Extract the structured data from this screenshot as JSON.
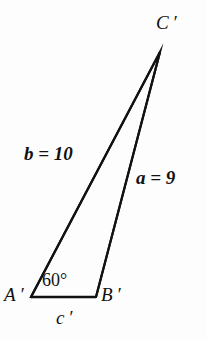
{
  "figure": {
    "type": "geometry-diagram",
    "shape": "triangle",
    "background_color": "#fdfdfd",
    "line_color": "#111111",
    "line_width_px": 2,
    "vertices": [
      {
        "id": "A",
        "label": "A ′",
        "x": 31,
        "y": 297
      },
      {
        "id": "B",
        "label": "B ′",
        "x": 96,
        "y": 297
      },
      {
        "id": "C",
        "label": "C ′",
        "x": 160,
        "y": 52
      }
    ],
    "sides": [
      {
        "id": "a",
        "label": "a = 9",
        "from": "B",
        "to": "C",
        "value": 9,
        "symbol": "a"
      },
      {
        "id": "b",
        "label": "b = 10",
        "from": "A",
        "to": "C",
        "value": 10,
        "symbol": "b"
      },
      {
        "id": "c",
        "label": "c ′",
        "from": "A",
        "to": "B",
        "value": null,
        "symbol": "c"
      }
    ],
    "angles": [
      {
        "at": "A",
        "label": "60°",
        "degrees": 60
      }
    ],
    "labels": {
      "vertex_C": "C ′",
      "vertex_A": "A ′",
      "vertex_B": "B ′",
      "side_b": "b = 10",
      "side_a": "a = 9",
      "side_c": "c ′",
      "angle_A": "60°"
    }
  }
}
